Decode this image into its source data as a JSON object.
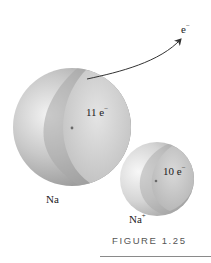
{
  "figure": {
    "caption": "FIGURE 1.25",
    "electron_label": {
      "base": "e",
      "sup": "−"
    },
    "atoms": [
      {
        "id": "na",
        "name": "Na",
        "name_sup": "",
        "electrons": "11 e",
        "electrons_sup": "−"
      },
      {
        "id": "na-ion",
        "name": "Na",
        "name_sup": "+",
        "electrons": "10 e",
        "electrons_sup": "−"
      }
    ]
  },
  "colors": {
    "sphere_light": "#ececec",
    "sphere_mid": "#b8b8b8",
    "sphere_dark": "#7a7a7a",
    "arrow": "#333333",
    "caption": "#555555",
    "rule": "#8a8a8a"
  }
}
